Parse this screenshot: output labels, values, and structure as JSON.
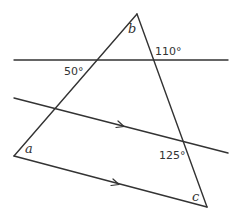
{
  "diagram": {
    "type": "geometry",
    "colors": {
      "line": "#333333",
      "background": "#ffffff"
    },
    "labels": {
      "angle_b": "b",
      "angle_a": "a",
      "angle_c": "c",
      "angle_50": "50°",
      "angle_110": "110°",
      "angle_125": "125°"
    },
    "points": {
      "apex_b": [
        137,
        14
      ],
      "vertex_a": [
        14,
        156
      ],
      "vertex_c": [
        207,
        207
      ]
    },
    "lines": [
      {
        "name": "horizontal-line",
        "from": [
          14,
          60
        ],
        "to": [
          228,
          60
        ]
      },
      {
        "name": "middle-parallel-line",
        "from": [
          14,
          98
        ],
        "to": [
          228,
          153
        ],
        "arrow": true
      },
      {
        "name": "bottom-parallel-line",
        "from": [
          14,
          156
        ],
        "to": [
          207,
          207
        ],
        "arrow": true
      },
      {
        "name": "left-side",
        "from": [
          137,
          14
        ],
        "to": [
          14,
          156
        ]
      },
      {
        "name": "right-side",
        "from": [
          137,
          14
        ],
        "to": [
          207,
          207
        ]
      }
    ]
  }
}
